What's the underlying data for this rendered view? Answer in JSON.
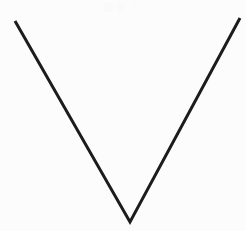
{
  "canvas": {
    "width": 246,
    "height": 231,
    "background_color": "#fcfcfc",
    "title": "V shape line drawing"
  },
  "figure": {
    "name": "v-shape",
    "stroke_color": "#1c1c1c",
    "stroke_width": 3,
    "points": {
      "left_top": {
        "x": 15,
        "y": 21
      },
      "vertex": {
        "x": 130,
        "y": 222
      },
      "right_top": {
        "x": 240,
        "y": 18
      }
    },
    "path": "M 15 21 L 130 222 L 240 18",
    "segments": [
      {
        "name": "left-arm",
        "from": {
          "x": 15,
          "y": 21
        },
        "to": {
          "x": 130,
          "y": 222
        }
      },
      {
        "name": "right-arm",
        "from": {
          "x": 130,
          "y": 222
        },
        "to": {
          "x": 240,
          "y": 18
        }
      }
    ]
  },
  "artifacts": {
    "note": "faint near-white compression speckles near top center",
    "blobs": [
      {
        "x": 104,
        "y": 3,
        "width": 9,
        "height": 9,
        "color": "#fafafa"
      },
      {
        "x": 117,
        "y": 2,
        "width": 8,
        "height": 10,
        "color": "#fafafa"
      },
      {
        "x": 132,
        "y": 0,
        "width": 10,
        "height": 6,
        "color": "#fbfbfb"
      }
    ]
  }
}
